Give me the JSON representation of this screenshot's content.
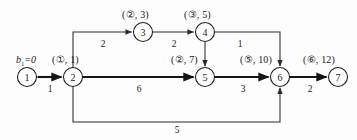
{
  "diagram": {
    "type": "directed-network-shortest-path",
    "source_label": "b",
    "source_sub": "1",
    "source_value": "=0",
    "source_label_full": "b₁=0",
    "nodes": [
      {
        "id": "1",
        "num": "1",
        "cx": 27,
        "cy": 77,
        "r": 9.5,
        "label": "",
        "label_x": 0,
        "label_y": 0
      },
      {
        "id": "2",
        "num": "2",
        "cx": 73,
        "cy": 77,
        "r": 9.5,
        "label": "(①, 1)",
        "label_x": 52,
        "label_y": 55
      },
      {
        "id": "3",
        "num": "3",
        "cx": 143,
        "cy": 32,
        "r": 9.5,
        "label": "(②, 3)",
        "label_x": 122,
        "label_y": 10
      },
      {
        "id": "4",
        "num": "4",
        "cx": 205,
        "cy": 32,
        "r": 9.5,
        "label": "(③, 5)",
        "label_x": 184,
        "label_y": 10
      },
      {
        "id": "5",
        "num": "5",
        "cx": 205,
        "cy": 77,
        "r": 9.5,
        "label": "(②, 7)",
        "label_x": 171,
        "label_y": 55
      },
      {
        "id": "6",
        "num": "6",
        "cx": 280,
        "cy": 77,
        "r": 9.5,
        "label": "(⑤, 10)",
        "label_x": 240,
        "label_y": 55
      },
      {
        "id": "7",
        "num": "7",
        "cx": 338,
        "cy": 77,
        "r": 9.5,
        "label": "(⑥, 12)",
        "label_x": 303,
        "label_y": 55
      }
    ],
    "edges": [
      {
        "from": "1",
        "to": "2",
        "weight": "1",
        "wx": 50,
        "wy": 89,
        "bold": true
      },
      {
        "from": "2",
        "to": "3",
        "weight": "2",
        "wx": 103,
        "wy": 44,
        "bold": false
      },
      {
        "from": "3",
        "to": "4",
        "weight": "2",
        "wx": 174,
        "wy": 44,
        "bold": false
      },
      {
        "from": "4",
        "to": "6",
        "weight": "1",
        "wx": 240,
        "wy": 44,
        "bold": false
      },
      {
        "from": "4",
        "to": "5",
        "weight": "",
        "wx": 0,
        "wy": 0,
        "bold": false
      },
      {
        "from": "2",
        "to": "5",
        "weight": "6",
        "wx": 139,
        "wy": 89,
        "bold": true
      },
      {
        "from": "5",
        "to": "6",
        "weight": "3",
        "wx": 243,
        "wy": 89,
        "bold": true
      },
      {
        "from": "6",
        "to": "7",
        "weight": "2",
        "wx": 310,
        "wy": 89,
        "bold": true
      },
      {
        "from": "2",
        "to": "6",
        "weight": "5",
        "wx": 177,
        "wy": 128,
        "bold": false
      }
    ],
    "colors": {
      "background": "#fdfdfd",
      "stroke": "#1f1f1f",
      "bold_stroke": "#141414",
      "text": "#1a1a1a"
    }
  }
}
